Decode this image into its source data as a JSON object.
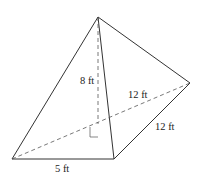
{
  "figure": {
    "type": "triangular pyramid",
    "labels": {
      "height": "8 ft",
      "base_diagonal": "12 ft",
      "right_edge": "12 ft",
      "bottom_edge": "5 ft"
    },
    "colors": {
      "line": "#333333",
      "background": "#ffffff"
    }
  }
}
